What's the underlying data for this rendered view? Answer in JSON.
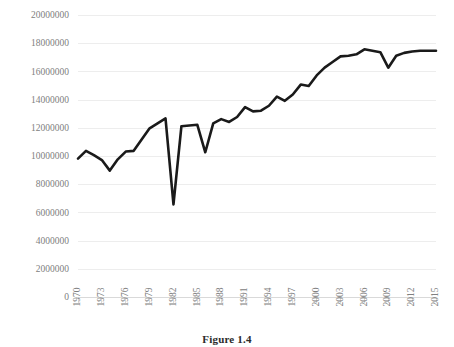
{
  "figure": {
    "caption": "Figure 1.4"
  },
  "chart_data": {
    "type": "line",
    "title": "",
    "subtitle": "",
    "xlabel": "",
    "ylabel": "",
    "grid": true,
    "legend": false,
    "legend_position": "none",
    "line_color": "#1a1a1a",
    "gridline_color": "#ededed",
    "tick_label_color": "#808080",
    "xlim": [
      1970,
      2015
    ],
    "ylim": [
      0,
      20000000
    ],
    "ytick_step": 2000000,
    "xtick_step": 3,
    "ytick_labels": [
      "0",
      "2000000",
      "4000000",
      "6000000",
      "8000000",
      "10000000",
      "12000000",
      "14000000",
      "16000000",
      "18000000",
      "20000000"
    ],
    "ytick_values": [
      0,
      2000000,
      4000000,
      6000000,
      8000000,
      10000000,
      12000000,
      14000000,
      16000000,
      18000000,
      20000000
    ],
    "xtick_labels": [
      "1970",
      "1973",
      "1976",
      "1979",
      "1982",
      "1985",
      "1988",
      "1991",
      "1994",
      "1997",
      "2000",
      "2003",
      "2006",
      "2009",
      "2012",
      "2015"
    ],
    "x": [
      1970,
      1971,
      1972,
      1973,
      1974,
      1975,
      1976,
      1977,
      1978,
      1979,
      1980,
      1981,
      1982,
      1983,
      1984,
      1985,
      1986,
      1987,
      1988,
      1989,
      1990,
      1991,
      1992,
      1993,
      1994,
      1995,
      1996,
      1997,
      1998,
      1999,
      2000,
      2001,
      2002,
      2003,
      2004,
      2005,
      2006,
      2007,
      2008,
      2009,
      2010,
      2011,
      2012,
      2013,
      2014,
      2015
    ],
    "values": [
      9850000,
      10400000,
      10100000,
      9750000,
      9000000,
      9800000,
      10350000,
      10400000,
      11200000,
      12000000,
      12350000,
      12700000,
      6600000,
      12150000,
      12200000,
      12250000,
      10300000,
      12350000,
      12650000,
      12450000,
      12800000,
      13500000,
      13200000,
      13250000,
      13600000,
      14250000,
      13950000,
      14400000,
      15100000,
      15000000,
      15750000,
      16300000,
      16700000,
      17100000,
      17150000,
      17250000,
      17600000,
      17500000,
      17400000,
      16300000,
      17150000,
      17350000,
      17450000,
      17500000,
      17500000,
      17500000
    ],
    "annotations": []
  }
}
